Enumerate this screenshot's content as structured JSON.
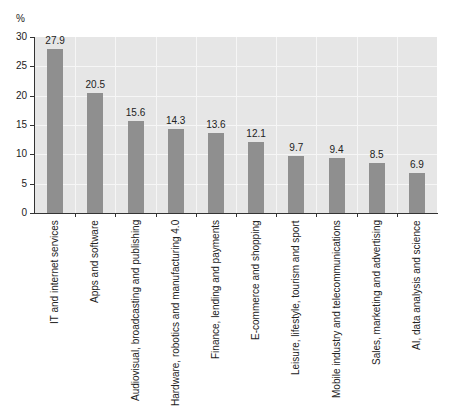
{
  "chart_data": {
    "type": "bar",
    "title": "",
    "xlabel": "",
    "ylabel": "%",
    "ylim": [
      0,
      30
    ],
    "yticks": [
      0,
      5,
      10,
      15,
      20,
      25,
      30
    ],
    "grid": true,
    "legend": null,
    "categories": [
      "IT and internet services",
      "Apps and software",
      "Audiovisual, broadcasting and publishing",
      "Hardware, robotics and manufacturing 4.0",
      "Finance, lending and payments",
      "E-commerce and shopping",
      "Leisure, lifestyle, tourism and sport",
      "Mobile industry and telecommunications",
      "Sales, marketing and advertising",
      "AI, data analysis and science"
    ],
    "values": [
      27.9,
      20.5,
      15.6,
      14.3,
      13.6,
      12.1,
      9.7,
      9.4,
      8.5,
      6.9
    ],
    "value_labels": [
      "27.9",
      "20.5",
      "15.6",
      "14.3",
      "13.6",
      "12.1",
      "9.7",
      "9.4",
      "8.5",
      "6.9"
    ],
    "colors": {
      "bar": "#8f8f8f",
      "plot_background": "#e6e6e6",
      "grid": "#f6f6f6"
    }
  }
}
